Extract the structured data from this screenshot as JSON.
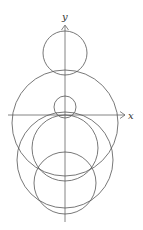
{
  "diagram": {
    "type": "circles-on-axes",
    "stroke_color": "#555555",
    "axis_color": "#666666",
    "axes": {
      "x_label": "x",
      "y_label": "y"
    },
    "circles": [
      {
        "name": "top-circle",
        "cx": 65,
        "cy": 53,
        "r": 22
      },
      {
        "name": "large-circle",
        "cx": 65,
        "cy": 123,
        "r": 53
      },
      {
        "name": "small-circle-near-origin",
        "cx": 65,
        "cy": 107,
        "r": 11
      },
      {
        "name": "circle-through-origin",
        "cx": 65,
        "cy": 148,
        "r": 33
      },
      {
        "name": "wide-lower-circle",
        "cx": 65,
        "cy": 160,
        "r": 48
      },
      {
        "name": "bottom-circle",
        "cx": 65,
        "cy": 183,
        "r": 31
      }
    ]
  }
}
